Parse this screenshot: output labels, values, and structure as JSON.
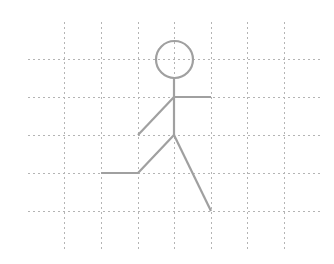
{
  "diagram": {
    "colors": {
      "background": "#ffffff",
      "grid": "#b4b4b4",
      "figure": "#a0a0a0"
    },
    "grid": {
      "vertical_x": [
        64,
        101,
        138,
        174,
        211,
        247,
        284
      ],
      "vertical_y_range": [
        22,
        250
      ],
      "horizontal_y": [
        59,
        97,
        135,
        173,
        211
      ],
      "horizontal_x_range": [
        28,
        320
      ],
      "dash": "2 3"
    },
    "figure": {
      "head": {
        "cx": 174.5,
        "cy": 59.5,
        "r": 18.5
      },
      "segments": [
        {
          "name": "torso",
          "points": [
            [
              174,
              78
            ],
            [
              174,
              135
            ]
          ]
        },
        {
          "name": "arm-right",
          "points": [
            [
              174,
              97
            ],
            [
              211,
              97
            ]
          ]
        },
        {
          "name": "arm-left",
          "points": [
            [
              174,
              97
            ],
            [
              138,
              135
            ]
          ]
        },
        {
          "name": "leg-left",
          "points": [
            [
              174,
              135
            ],
            [
              138,
              173
            ],
            [
              101,
              173
            ]
          ]
        },
        {
          "name": "leg-right",
          "points": [
            [
              174,
              135
            ],
            [
              211,
              211
            ]
          ]
        }
      ],
      "stroke_width": 2.2
    }
  }
}
